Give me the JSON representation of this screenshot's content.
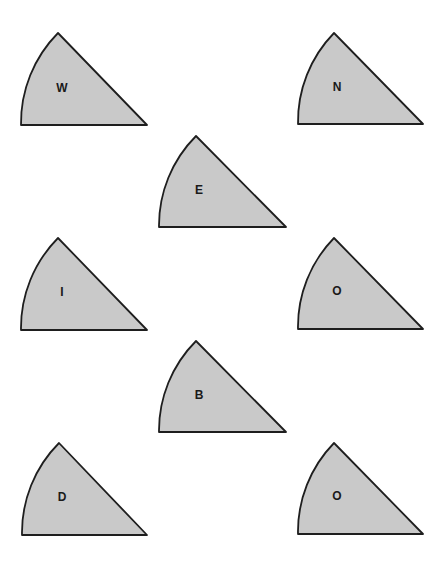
{
  "diagram": {
    "fill_color": "#c9c9c9",
    "stroke_color": "#1e1e1e",
    "background": "#ffffff",
    "pieces": [
      {
        "label": "W",
        "apex": [
          58,
          33
        ],
        "bottom_left": [
          21,
          125
        ],
        "bottom_right": [
          147,
          125
        ],
        "label_pos": [
          62,
          88
        ]
      },
      {
        "label": "N",
        "apex": [
          334,
          33
        ],
        "bottom_left": [
          298,
          124
        ],
        "bottom_right": [
          423,
          124
        ],
        "label_pos": [
          337,
          87
        ]
      },
      {
        "label": "E",
        "apex": [
          196,
          136
        ],
        "bottom_left": [
          159,
          227
        ],
        "bottom_right": [
          286,
          227
        ],
        "label_pos": [
          199,
          190
        ]
      },
      {
        "label": "I",
        "apex": [
          58,
          238
        ],
        "bottom_left": [
          21,
          330
        ],
        "bottom_right": [
          147,
          330
        ],
        "label_pos": [
          62,
          292
        ]
      },
      {
        "label": "O",
        "apex": [
          334,
          238
        ],
        "bottom_left": [
          298,
          329
        ],
        "bottom_right": [
          423,
          329
        ],
        "label_pos": [
          337,
          291
        ]
      },
      {
        "label": "B",
        "apex": [
          196,
          341
        ],
        "bottom_left": [
          159,
          432
        ],
        "bottom_right": [
          286,
          432
        ],
        "label_pos": [
          199,
          395
        ]
      },
      {
        "label": "D",
        "apex": [
          59,
          443
        ],
        "bottom_left": [
          22,
          535
        ],
        "bottom_right": [
          147,
          535
        ],
        "label_pos": [
          62,
          497
        ]
      },
      {
        "label": "O",
        "apex": [
          334,
          443
        ],
        "bottom_left": [
          298,
          534
        ],
        "bottom_right": [
          423,
          534
        ],
        "label_pos": [
          337,
          496
        ]
      }
    ]
  }
}
